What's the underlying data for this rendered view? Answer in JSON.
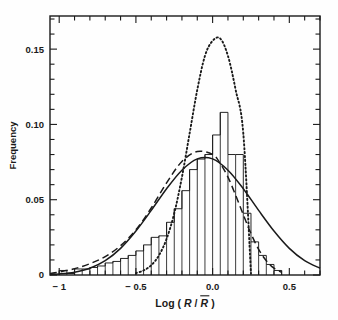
{
  "figure": {
    "kind": "histogram-with-fitted-curves",
    "background_color": "#fefefe",
    "ink_color": "#1a1a1a"
  },
  "axes": {
    "x": {
      "label_parts": {
        "prefix": "Log (",
        "var1": "R",
        "slash": "/",
        "var2": "R",
        "suffix": ")",
        "overbar_on_var2": true
      },
      "label_plain": "Log ( R / R̅ )",
      "tick_labels": [
        "-1",
        "-0.5",
        "0.0",
        "0.5"
      ],
      "tick_values": [
        -1,
        -0.5,
        0,
        0.5
      ],
      "minor_tick_step": 0.1,
      "range": [
        -1.06,
        0.7
      ]
    },
    "y": {
      "label": "Frequency",
      "tick_labels": [
        "0",
        "0.05",
        "0.10",
        "0.15"
      ],
      "tick_values": [
        0,
        0.05,
        0.1,
        0.15
      ],
      "minor_tick_step": 0.01,
      "range": [
        0,
        0.172
      ]
    },
    "frame": {
      "left_px": 50,
      "right_px": 320,
      "top_px": 16,
      "bottom_px": 275
    },
    "grid": false,
    "legend": "none"
  },
  "chart_data": {
    "type": "bar",
    "title": "",
    "subtitle": "",
    "xlabel": "Log ( R / R̅ )",
    "ylabel": "Frequency",
    "xlim": [
      -1.06,
      0.7
    ],
    "ylim": [
      0,
      0.172
    ],
    "grid": false,
    "legend_position": "none",
    "annotations": [],
    "bin_width": 0.05,
    "categories": [
      "-1.00",
      "-0.95",
      "-0.90",
      "-0.85",
      "-0.80",
      "-0.75",
      "-0.70",
      "-0.65",
      "-0.60",
      "-0.55",
      "-0.50",
      "-0.45",
      "-0.40",
      "-0.35",
      "-0.30",
      "-0.25",
      "-0.20",
      "-0.15",
      "-0.10",
      "-0.05",
      "0.00",
      "0.05",
      "0.10",
      "0.15",
      "0.20",
      "0.25",
      "0.30",
      "0.35",
      "0.40"
    ],
    "values": [
      0.003,
      0.001,
      0.004,
      0.004,
      0.005,
      0.006,
      0.008,
      0.009,
      0.011,
      0.013,
      0.016,
      0.02,
      0.025,
      0.026,
      0.035,
      0.044,
      0.056,
      0.07,
      0.077,
      0.08,
      0.093,
      0.108,
      0.08,
      0.08,
      0.041,
      0.022,
      0.013,
      0.007,
      0.003
    ],
    "series": [
      {
        "name": "histogram",
        "style": "bars-outline",
        "values": [
          0.003,
          0.001,
          0.004,
          0.004,
          0.005,
          0.006,
          0.008,
          0.009,
          0.011,
          0.013,
          0.016,
          0.02,
          0.025,
          0.026,
          0.035,
          0.044,
          0.056,
          0.07,
          0.077,
          0.08,
          0.093,
          0.108,
          0.08,
          0.08,
          0.041,
          0.022,
          0.013,
          0.007,
          0.003
        ]
      },
      {
        "name": "solid-curve",
        "style": "solid",
        "peak_x": -0.07,
        "peak_y": 0.0775,
        "sigma_left": 0.26,
        "sigma_right": 0.26,
        "skew": 0.0,
        "x": [
          -1.06,
          -1.0,
          -0.9,
          -0.8,
          -0.7,
          -0.6,
          -0.5,
          -0.4,
          -0.3,
          -0.2,
          -0.1,
          0.0,
          0.1,
          0.2,
          0.3,
          0.4,
          0.5,
          0.6,
          0.7
        ],
        "y": [
          0.0004,
          0.0007,
          0.0019,
          0.0045,
          0.0095,
          0.0177,
          0.0292,
          0.0429,
          0.0573,
          0.0696,
          0.0771,
          0.0771,
          0.0696,
          0.0573,
          0.0429,
          0.0292,
          0.0177,
          0.0095,
          0.0045
        ]
      },
      {
        "name": "dashed-curve",
        "style": "dashed",
        "peak_x": -0.04,
        "peak_y": 0.0825,
        "x": [
          -1.06,
          -1.0,
          -0.9,
          -0.8,
          -0.7,
          -0.6,
          -0.5,
          -0.4,
          -0.3,
          -0.2,
          -0.1,
          0.0,
          0.05,
          0.1,
          0.15,
          0.2,
          0.25,
          0.3,
          0.35,
          0.4,
          0.45
        ],
        "y": [
          0.001,
          0.002,
          0.0042,
          0.0075,
          0.0122,
          0.0195,
          0.03,
          0.0445,
          0.0612,
          0.0754,
          0.082,
          0.08,
          0.074,
          0.065,
          0.053,
          0.04,
          0.0275,
          0.017,
          0.0095,
          0.0045,
          0.0018
        ]
      },
      {
        "name": "dotted-curve",
        "style": "dotted",
        "peak_x": 0.05,
        "peak_y": 0.157,
        "sigma": 0.105,
        "x": [
          -0.5,
          -0.45,
          -0.4,
          -0.35,
          -0.3,
          -0.25,
          -0.2,
          -0.15,
          -0.1,
          -0.05,
          0.0,
          0.05,
          0.1,
          0.15,
          0.2,
          0.25
        ],
        "y": [
          0.0013,
          0.003,
          0.0065,
          0.013,
          0.024,
          0.041,
          0.065,
          0.094,
          0.123,
          0.1455,
          0.1555,
          0.157,
          0.1455,
          0.123,
          0.094,
          0.001
        ]
      }
    ]
  }
}
